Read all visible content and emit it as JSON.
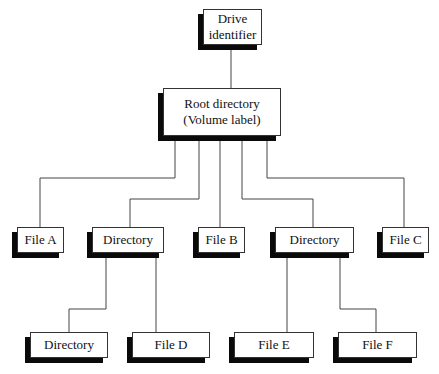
{
  "diagram": {
    "type": "directory-tree",
    "nodes": [
      {
        "id": "drive",
        "label": "Drive identifier",
        "lines": [
          "Drive",
          "identifier"
        ],
        "x": 203,
        "y": 9,
        "w": 59,
        "h": 36
      },
      {
        "id": "root",
        "label": "Root directory (Volume label)",
        "lines": [
          "Root directory",
          "(Volume label)"
        ],
        "x": 163,
        "y": 88,
        "w": 118,
        "h": 48
      },
      {
        "id": "fileA",
        "label": "File A",
        "lines": [
          "File A"
        ],
        "x": 17,
        "y": 227,
        "w": 47,
        "h": 26
      },
      {
        "id": "dir1",
        "label": "Directory",
        "lines": [
          "Directory"
        ],
        "x": 92,
        "y": 227,
        "w": 72,
        "h": 26
      },
      {
        "id": "fileB",
        "label": "File B",
        "lines": [
          "File B"
        ],
        "x": 198,
        "y": 227,
        "w": 47,
        "h": 26
      },
      {
        "id": "dir2",
        "label": "Directory",
        "lines": [
          "Directory"
        ],
        "x": 275,
        "y": 227,
        "w": 79,
        "h": 26
      },
      {
        "id": "fileC",
        "label": "File C",
        "lines": [
          "File C"
        ],
        "x": 382,
        "y": 227,
        "w": 47,
        "h": 26
      },
      {
        "id": "dir3",
        "label": "Directory",
        "lines": [
          "Directory"
        ],
        "x": 30,
        "y": 332,
        "w": 78,
        "h": 26
      },
      {
        "id": "fileD",
        "label": "File D",
        "lines": [
          "File D"
        ],
        "x": 132,
        "y": 332,
        "w": 78,
        "h": 26
      },
      {
        "id": "fileE",
        "label": "File E",
        "lines": [
          "File E"
        ],
        "x": 234,
        "y": 332,
        "w": 80,
        "h": 26
      },
      {
        "id": "fileF",
        "label": "File F",
        "lines": [
          "File F"
        ],
        "x": 338,
        "y": 332,
        "w": 79,
        "h": 26
      }
    ],
    "edges": [
      {
        "from": "drive",
        "to": "root",
        "points": [
          [
            231,
            45
          ],
          [
            231,
            88
          ]
        ]
      },
      {
        "from": "root",
        "to": "fileA",
        "points": [
          [
            175,
            141
          ],
          [
            175,
            178
          ],
          [
            40,
            178
          ],
          [
            40,
            227
          ]
        ]
      },
      {
        "from": "root",
        "to": "dir1",
        "points": [
          [
            199,
            141
          ],
          [
            199,
            199
          ],
          [
            130,
            199
          ],
          [
            130,
            227
          ]
        ]
      },
      {
        "from": "root",
        "to": "fileB",
        "points": [
          [
            220,
            141
          ],
          [
            220,
            227
          ]
        ]
      },
      {
        "from": "root",
        "to": "dir2",
        "points": [
          [
            242,
            141
          ],
          [
            242,
            199
          ],
          [
            313,
            199
          ],
          [
            313,
            227
          ]
        ]
      },
      {
        "from": "root",
        "to": "fileC",
        "points": [
          [
            267,
            141
          ],
          [
            267,
            178
          ],
          [
            404,
            178
          ],
          [
            404,
            227
          ]
        ]
      },
      {
        "from": "dir1",
        "to": "dir3",
        "points": [
          [
            106,
            258
          ],
          [
            106,
            309
          ],
          [
            69,
            309
          ],
          [
            69,
            332
          ]
        ]
      },
      {
        "from": "dir1",
        "to": "fileD",
        "points": [
          [
            156,
            258
          ],
          [
            156,
            332
          ]
        ]
      },
      {
        "from": "dir2",
        "to": "fileE",
        "points": [
          [
            287,
            258
          ],
          [
            287,
            332
          ]
        ]
      },
      {
        "from": "dir2",
        "to": "fileF",
        "points": [
          [
            340,
            258
          ],
          [
            340,
            309
          ],
          [
            376,
            309
          ],
          [
            376,
            332
          ]
        ]
      }
    ],
    "shadow": {
      "dx": -5,
      "dy": 5,
      "color": "#0a0a0a"
    }
  }
}
